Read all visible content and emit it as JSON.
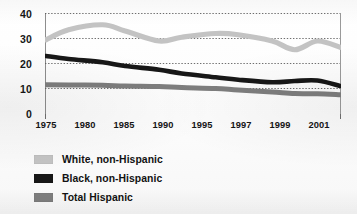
{
  "chart_data": {
    "type": "line",
    "title": "",
    "xlabel": "",
    "ylabel": "",
    "categories": [
      "1975",
      "1980",
      "1985",
      "1990",
      "1995",
      "1997",
      "1999",
      "2001"
    ],
    "x_tick_labels": [
      "1975",
      "1980",
      "1985",
      "1990",
      "1995",
      "1997",
      "1999",
      "2001"
    ],
    "y_tick_labels": [
      "40",
      "30",
      "20",
      "10",
      "0"
    ],
    "ylim": [
      0,
      40
    ],
    "y_ticks": [
      0,
      10,
      20,
      30,
      40
    ],
    "grid": "horizontal-dotted",
    "legend_position": "below-left",
    "series": [
      {
        "name": "White, non-Hispanic",
        "color": "#c3c3c3",
        "values": [
          29.5,
          35.5,
          29.0,
          32.0,
          29.0,
          25.5,
          29.0,
          26.5
        ],
        "dense_x": [
          1975,
          1977,
          1980,
          1982,
          1985,
          1987,
          1990,
          1992,
          1995,
          1997,
          1999,
          2001
        ],
        "dense_values": [
          29.5,
          33.5,
          35.5,
          33.0,
          29.0,
          30.5,
          32.0,
          31.5,
          29.0,
          25.5,
          29.0,
          26.5
        ]
      },
      {
        "name": "Black, non-Hispanic",
        "color": "#171717",
        "values": [
          23.0,
          20.5,
          17.5,
          14.5,
          12.5,
          13.0,
          13.0,
          11.0
        ],
        "dense_x": [
          1975,
          1977,
          1980,
          1982,
          1985,
          1987,
          1990,
          1992,
          1995,
          1997,
          1999,
          2001
        ],
        "dense_values": [
          23.0,
          21.8,
          20.5,
          19.0,
          17.5,
          16.0,
          14.5,
          13.5,
          12.5,
          13.0,
          13.2,
          11.0
        ]
      },
      {
        "name": "Total Hispanic",
        "color": "#7e7e7e",
        "values": [
          11.5,
          11.3,
          10.8,
          10.0,
          8.6,
          8.0,
          7.8,
          7.5
        ],
        "dense_x": [
          1975,
          1977,
          1980,
          1982,
          1985,
          1987,
          1990,
          1992,
          1995,
          1997,
          1999,
          2001
        ],
        "dense_values": [
          11.5,
          11.4,
          11.3,
          11.0,
          10.8,
          10.4,
          10.0,
          9.4,
          8.6,
          8.0,
          7.9,
          7.5
        ]
      }
    ]
  },
  "legend": {
    "items": [
      {
        "label": "White, non-Hispanic",
        "color": "#c3c3c3"
      },
      {
        "label": "Black, non-Hispanic",
        "color": "#171717"
      },
      {
        "label": "Total Hispanic",
        "color": "#7e7e7e"
      }
    ]
  }
}
